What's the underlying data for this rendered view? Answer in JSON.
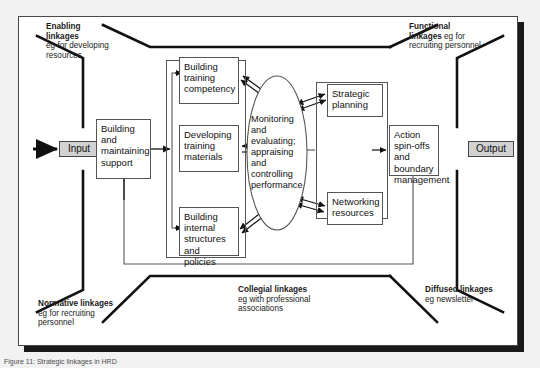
{
  "figure": {
    "caption": "Figure 11: Strategic linkages in HRD"
  },
  "io": {
    "input_label": "Input",
    "output_label": "Output"
  },
  "linkages": [
    {
      "id": "enabling",
      "title": "Enabling linkages",
      "detail": "eg for developing resources",
      "title_line1": "Enabling",
      "title_line2": "linkages",
      "detail_line1": "eg for developing",
      "detail_line2": "resources"
    },
    {
      "id": "functional",
      "title": "Functional linkages",
      "detail": "eg for recruiting personnel",
      "title_line1": "Functional",
      "title_line2": "linkages",
      "inline_after_title": " eg for",
      "detail_line2": "recruiting personnel"
    },
    {
      "id": "normative",
      "title": "Normative linkages",
      "detail": "eg for recruiting personnel",
      "detail_line1": "eg for recruiting",
      "detail_line2": "personnel"
    },
    {
      "id": "collegial",
      "title": "Collegial linkages",
      "detail": "eg with professional associations",
      "detail_line1": "eg with professional",
      "detail_line2": "associations"
    },
    {
      "id": "diffused",
      "title": "Diffused linkages",
      "detail": "eg newsletter",
      "detail_line1": "eg newsletter",
      "detail_line2": ""
    }
  ],
  "nodes": {
    "support": "Building and maintaining support",
    "competency": "Building training competency",
    "materials": "Developing training materials",
    "structures": "Building internal structures and policies",
    "monitoring": "Monitoring and evaluating; appraising and controlling performance",
    "strategic": "Strategic planning",
    "networking": "Networking resources",
    "action": "Action spin-offs and boundary management"
  },
  "colors": {
    "line": "#555555",
    "boundary": "#111111",
    "io_fill": "#d2d2d2",
    "page_bg": "#f2f2f2",
    "card_bg": "#ffffff",
    "shadow": "#1a1a1a"
  }
}
